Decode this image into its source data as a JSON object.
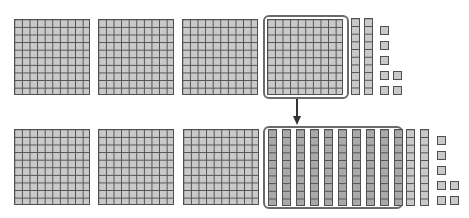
{
  "diagram": {
    "colors": {
      "block_fill": "#c9c9c9",
      "block_fill_regrouped": "#a9a9a9",
      "grid_line": "#505050",
      "highlight_border": "#6a6a6a",
      "arrow": "#333333"
    },
    "top_row": {
      "hundreds": 4,
      "tens": 2,
      "ones": 7,
      "highlighted": "fourth hundred flat"
    },
    "bottom_row": {
      "hundreds": 3,
      "tens_regrouped": 10,
      "tens": 2,
      "ones": 7,
      "highlighted": "ten tens rods"
    },
    "arrow": "down from highlighted hundred to highlighted tens"
  }
}
